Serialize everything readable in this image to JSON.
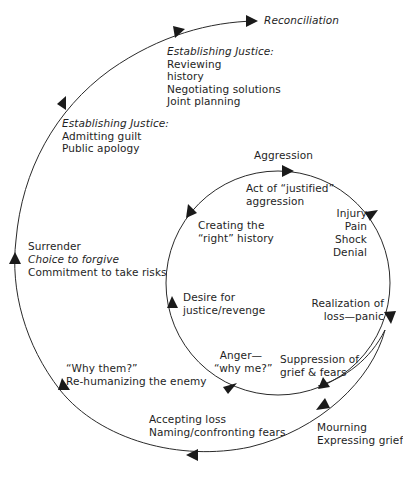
{
  "colors": {
    "stroke": "#2a2a2a",
    "text": "#1e1e1e",
    "background": "#ffffff"
  },
  "outer_path": {
    "reconciliation": "Reconciliation",
    "justice2": {
      "heading": "Establishing Justice:",
      "items": [
        "Reviewing",
        "history",
        "Negotiating solutions",
        "Joint planning"
      ]
    },
    "justice1": {
      "heading": "Establishing Justice:",
      "items": [
        "Admitting guilt",
        "Public apology"
      ]
    },
    "surrender": {
      "line1": "Surrender",
      "line2": "Choice to forgive",
      "line3": "Commitment to take risks"
    },
    "why_them": {
      "line1": "“Why them?”",
      "line2": "Re-humanizing the enemy"
    },
    "accepting": {
      "line1": "Accepting loss",
      "line2": "Naming/confronting fears"
    },
    "mourning": {
      "line1": "Mourning",
      "line2": "Expressing grief"
    }
  },
  "inner_cycle": {
    "aggression": "Aggression",
    "act": {
      "line1": "Act of “justified”",
      "line2": "aggression"
    },
    "injury": [
      "Injury",
      "Pain",
      "Shock",
      "Denial"
    ],
    "realization": {
      "line1": "Realization of",
      "line2": "loss—panic"
    },
    "suppression": {
      "line1": "Suppression of",
      "line2": "grief & fears"
    },
    "anger": {
      "line1": "Anger—",
      "line2": "“why me?”"
    },
    "desire": {
      "line1": "Desire for",
      "line2": "justice/revenge"
    },
    "creating": {
      "line1": "Creating the",
      "line2": "“right” history"
    }
  }
}
